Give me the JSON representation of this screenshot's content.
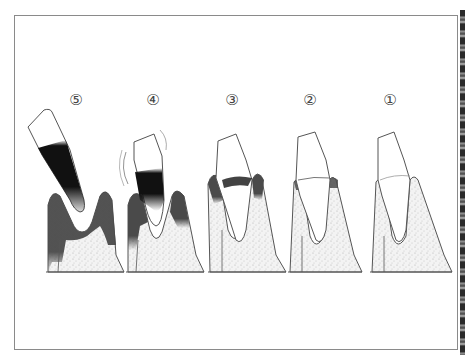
{
  "figure": {
    "type": "periodontal-disease-stages",
    "stages": [
      {
        "label": "⑤",
        "x": 72,
        "description": "tooth extruded, bone largely lost"
      },
      {
        "label": "④",
        "x": 152,
        "description": "tooth mobile, advanced bone loss"
      },
      {
        "label": "③",
        "x": 231,
        "description": "moderate pocket, bone loss"
      },
      {
        "label": "②",
        "x": 309,
        "description": "early gingival inflammation"
      },
      {
        "label": "①",
        "x": 391,
        "description": "healthy"
      }
    ]
  },
  "colors": {
    "frame": "#8a8a8a",
    "outline": "#555555",
    "gum_dark": "#4a4a4a",
    "bone_fill": "#ececec",
    "plaque": "#111111"
  }
}
